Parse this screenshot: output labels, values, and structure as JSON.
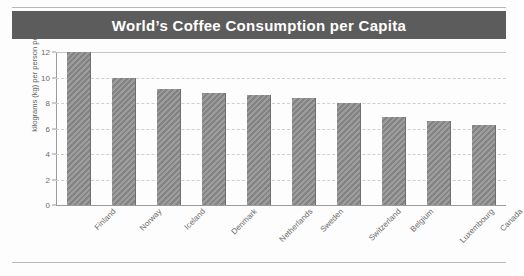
{
  "figure": {
    "title": "World’s Coffee Consumption per Capita",
    "banner_color": "#5c5c5c",
    "title_color": "#ffffff",
    "bar_color": "#8a8a8a",
    "grid_color": "#cfcfcf",
    "axis_color": "#9a9a9a"
  },
  "chart_data": {
    "type": "bar",
    "title": "World’s Coffee Consumption per Capita",
    "xlabel": "",
    "ylabel": "kilograms (kg) per person per year",
    "ylim": [
      0,
      12
    ],
    "yticks": [
      0,
      2,
      4,
      6,
      8,
      10,
      12
    ],
    "ytick_labels": [
      "0",
      "2",
      "4",
      "6",
      "8",
      "10",
      "12"
    ],
    "grid": true,
    "legend": false,
    "categories": [
      "Finland",
      "Norway",
      "Iceland",
      "Denmark",
      "Netherlands",
      "Sweden",
      "Switzerland",
      "Belgium",
      "Luxembourg",
      "Canada"
    ],
    "values": [
      12.0,
      10.0,
      9.1,
      8.8,
      8.6,
      8.4,
      8.0,
      6.9,
      6.6,
      6.3
    ]
  }
}
